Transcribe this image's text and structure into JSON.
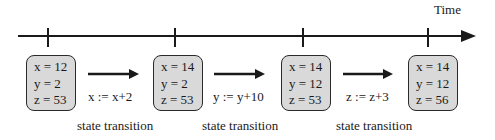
{
  "diagram": {
    "axis_label": "Time",
    "colors": {
      "line": "#1a1a1a",
      "box_fill": "#d9d9d9",
      "box_border": "#2a2a2a",
      "background": "#ffffff"
    },
    "states": [
      {
        "lines": [
          "x = 12",
          "y = 2",
          "z = 53"
        ]
      },
      {
        "lines": [
          "x = 14",
          "y = 2",
          "z = 53"
        ]
      },
      {
        "lines": [
          "x = 14",
          "y = 12",
          "z = 53"
        ]
      },
      {
        "lines": [
          "x = 14",
          "y = 12",
          "z = 56"
        ]
      }
    ],
    "transitions": [
      {
        "operation": "x := x+2",
        "caption": "state transition"
      },
      {
        "operation": "y := y+10",
        "caption": "state transition"
      },
      {
        "operation": "z := z+3",
        "caption": "state transition"
      }
    ]
  }
}
